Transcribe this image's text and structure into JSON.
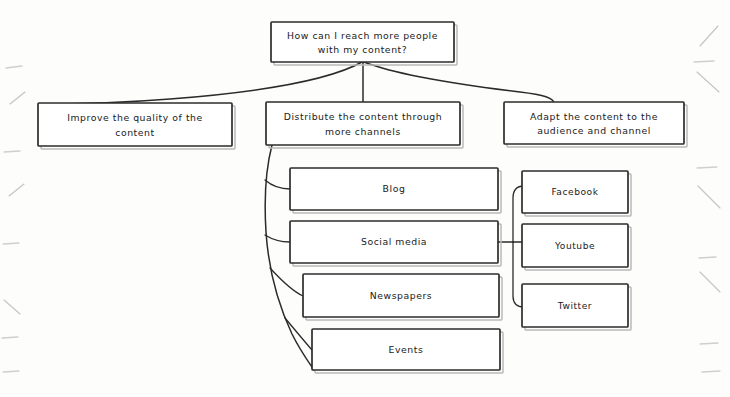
{
  "diagram": {
    "type": "hand-drawn-tree-diagram",
    "title_node": {
      "id": "root",
      "lines": [
        "How can I reach more people",
        "with my content?"
      ],
      "x": 271,
      "y": 22,
      "w": 183,
      "h": 40
    },
    "branches": [
      {
        "id": "branch-improve-quality",
        "lines": [
          "Improve the quality of the",
          "content"
        ],
        "x": 38,
        "y": 103,
        "w": 194,
        "h": 43
      },
      {
        "id": "branch-distribute-channels",
        "lines": [
          "Distribute the content through",
          "more channels"
        ],
        "x": 266,
        "y": 102,
        "w": 194,
        "h": 43
      },
      {
        "id": "branch-adapt-content",
        "lines": [
          "Adapt the content to the",
          "audience and channel"
        ],
        "x": 504,
        "y": 102,
        "w": 180,
        "h": 42
      }
    ],
    "channels": [
      {
        "id": "channel-blog",
        "label": "Blog",
        "x": 290,
        "y": 168,
        "w": 208,
        "h": 42
      },
      {
        "id": "channel-social-media",
        "label": "Social media",
        "x": 290,
        "y": 221,
        "w": 208,
        "h": 42
      },
      {
        "id": "channel-newspapers",
        "label": "Newspapers",
        "x": 303,
        "y": 274,
        "w": 196,
        "h": 43
      },
      {
        "id": "channel-events",
        "label": "Events",
        "x": 312,
        "y": 329,
        "w": 188,
        "h": 41
      }
    ],
    "social_platforms": [
      {
        "id": "platform-facebook",
        "label": "Facebook",
        "x": 522,
        "y": 171,
        "w": 106,
        "h": 42
      },
      {
        "id": "platform-youtube",
        "label": "Youtube",
        "x": 522,
        "y": 224,
        "w": 106,
        "h": 43
      },
      {
        "id": "platform-twitter",
        "label": "Twitter",
        "x": 522,
        "y": 284,
        "w": 106,
        "h": 43
      }
    ],
    "colors": {
      "background": "#fdfdfc",
      "node_fill": "#ffffff",
      "stroke": "#2d2d2d",
      "text": "#1a1a1a",
      "margin_mark": "#c4c4c4"
    }
  }
}
